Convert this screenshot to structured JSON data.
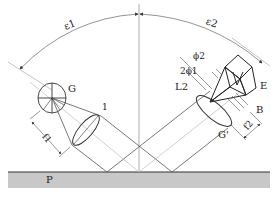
{
  "diagram": {
    "type": "optical-measurement-schematic",
    "colors": {
      "line": "#333333",
      "light_line": "#999999",
      "surface_fill": "#c8c8c8",
      "surface_edge": "#333333",
      "background": "#ffffff"
    },
    "labels": {
      "angle_incident": "ε1",
      "angle_reflected": "ε2",
      "source_grating": "G",
      "lens_1": "1",
      "focal_1": "f1",
      "phi_2": "ϕ2",
      "two_phi_1": "2ϕ1",
      "lens_2": "L2",
      "detector": "E",
      "baffle": "B",
      "grating_image": "G'",
      "focal_2": "f2",
      "surface": "P"
    }
  }
}
